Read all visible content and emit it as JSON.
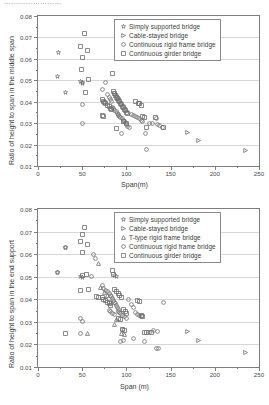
{
  "cut_title": "……………………",
  "charts": [
    {
      "id": "middle-span",
      "type": "scatter",
      "title": "",
      "xlabel": "Span(m)",
      "ylabel": "Ratio of height to span in the middle span",
      "xlim": [
        0,
        250
      ],
      "ylim": [
        0.01,
        0.08
      ],
      "xticks": [
        0,
        50,
        100,
        150,
        200,
        250
      ],
      "yticks": [
        0.01,
        0.02,
        0.03,
        0.04,
        0.05,
        0.06,
        0.07,
        0.08
      ],
      "ytick_labels": [
        "0.01",
        "0.02",
        "0.03",
        "0.04",
        "0.05",
        "0.06",
        "0.07",
        "0.08"
      ],
      "xtick_labels": [
        "0",
        "50",
        "100",
        "150",
        "200",
        "250"
      ],
      "grid": true,
      "legend_position": "top-right",
      "series": [
        {
          "name": "Simply supported bridge",
          "marker": "star",
          "points": [
            [
              22,
              0.0522
            ],
            [
              30,
              0.0447
            ],
            [
              48,
              0.0497
            ],
            [
              50,
              0.0493
            ],
            [
              50,
              0.0487
            ],
            [
              23,
              0.0633
            ]
          ]
        },
        {
          "name": "Cable-stayed bridge",
          "marker": "triangle-right",
          "points": [
            [
              169,
              0.0259
            ],
            [
              181,
              0.0221
            ],
            [
              234,
              0.0176
            ]
          ]
        },
        {
          "name": "Continuous rigid frame bridge",
          "marker": "circle",
          "points": [
            [
              50,
              0.0389
            ],
            [
              50,
              0.0299
            ],
            [
              72,
              0.046
            ],
            [
              76,
              0.0494
            ],
            [
              78,
              0.0437
            ],
            [
              80,
              0.0424
            ],
            [
              82,
              0.0413
            ],
            [
              83,
              0.0402
            ],
            [
              84,
              0.0377
            ],
            [
              85,
              0.037
            ],
            [
              86,
              0.0362
            ],
            [
              88,
              0.0356
            ],
            [
              89,
              0.0349
            ],
            [
              90,
              0.0343
            ],
            [
              91,
              0.0338
            ],
            [
              92,
              0.0333
            ],
            [
              93,
              0.0329
            ],
            [
              95,
              0.0322
            ],
            [
              96,
              0.0316
            ],
            [
              97,
              0.031
            ],
            [
              98,
              0.0304
            ],
            [
              100,
              0.0295
            ],
            [
              101,
              0.0289
            ],
            [
              103,
              0.028
            ],
            [
              94,
              0.0254
            ],
            [
              105,
              0.0344
            ],
            [
              108,
              0.0337
            ],
            [
              110,
              0.0333
            ],
            [
              112,
              0.0329
            ],
            [
              114,
              0.0322
            ],
            [
              116,
              0.0316
            ],
            [
              118,
              0.031
            ],
            [
              121,
              0.0252
            ],
            [
              122,
              0.018
            ],
            [
              126,
              0.0299
            ],
            [
              129,
              0.0302
            ],
            [
              133,
              0.0322
            ],
            [
              135,
              0.0295
            ],
            [
              137,
              0.0291
            ],
            [
              140,
              0.0282
            ],
            [
              86,
              0.0442
            ],
            [
              88,
              0.043
            ],
            [
              90,
              0.0416
            ]
          ]
        },
        {
          "name": "Continuous girder bridge",
          "marker": "square",
          "points": [
            [
              48,
              0.066
            ],
            [
              50,
              0.0609
            ],
            [
              52,
              0.0721
            ],
            [
              55,
              0.0641
            ],
            [
              49,
              0.0553
            ],
            [
              56,
              0.0508
            ],
            [
              53,
              0.0446
            ],
            [
              72,
              0.0411
            ],
            [
              74,
              0.0404
            ],
            [
              75,
              0.0398
            ],
            [
              76,
              0.0392
            ],
            [
              78,
              0.0385
            ],
            [
              80,
              0.0379
            ],
            [
              82,
              0.0372
            ],
            [
              83,
              0.0366
            ],
            [
              84,
              0.0536
            ],
            [
              85,
              0.0449
            ],
            [
              86,
              0.044
            ],
            [
              87,
              0.0432
            ],
            [
              88,
              0.0424
            ],
            [
              89,
              0.0416
            ],
            [
              90,
              0.0409
            ],
            [
              92,
              0.0402
            ],
            [
              93,
              0.0395
            ],
            [
              94,
              0.0388
            ],
            [
              95,
              0.0381
            ],
            [
              96,
              0.0374
            ],
            [
              97,
              0.0367
            ],
            [
              98,
              0.036
            ],
            [
              100,
              0.0353
            ],
            [
              101,
              0.0346
            ],
            [
              88,
              0.0276
            ],
            [
              96,
              0.031
            ],
            [
              99,
              0.0302
            ],
            [
              110,
              0.0402
            ],
            [
              113,
              0.0396
            ],
            [
              114,
              0.0392
            ],
            [
              116,
              0.0386
            ],
            [
              118,
              0.0333
            ],
            [
              120,
              0.0327
            ],
            [
              122,
              0.0281
            ],
            [
              132,
              0.033
            ],
            [
              141,
              0.0282
            ],
            [
              72,
              0.0339
            ],
            [
              74,
              0.0333
            ]
          ]
        }
      ]
    },
    {
      "id": "end-support",
      "type": "scatter",
      "title": "",
      "xlabel": "Span (m)",
      "ylabel": "Ratio of height to span in the end support",
      "xlim": [
        0,
        250
      ],
      "ylim": [
        0.01,
        0.08
      ],
      "xticks": [
        0,
        50,
        100,
        150,
        200,
        250
      ],
      "yticks": [
        0.01,
        0.02,
        0.03,
        0.04,
        0.05,
        0.06,
        0.07,
        0.08
      ],
      "ytick_labels": [
        "0.01",
        "0.02",
        "0.03",
        "0.04",
        "0.05",
        "0.06",
        "0.07",
        "0.08"
      ],
      "xtick_labels": [
        "0",
        "50",
        "100",
        "150",
        "200",
        "250"
      ],
      "grid": true,
      "legend_position": "top-right",
      "series": [
        {
          "name": "Simply supported bridge",
          "marker": "star",
          "points": [
            [
              22,
              0.052
            ],
            [
              30,
              0.0632
            ],
            [
              48,
              0.0502
            ],
            [
              50,
              0.0497
            ],
            [
              86,
              0.0508
            ],
            [
              88,
              0.0503
            ]
          ]
        },
        {
          "name": "Cable-stayed bridge",
          "marker": "triangle-right",
          "points": [
            [
              169,
              0.0259
            ],
            [
              181,
              0.022
            ],
            [
              234,
              0.0167
            ]
          ]
        },
        {
          "name": "T-type rigid frame bridge",
          "marker": "triangle-up",
          "points": [
            [
              55,
              0.0252
            ],
            [
              68,
              0.056
            ],
            [
              70,
              0.0454
            ],
            [
              75,
              0.0432
            ],
            [
              78,
              0.0418
            ],
            [
              82,
              0.0386
            ],
            [
              88,
              0.0312
            ],
            [
              94,
              0.0251
            ],
            [
              97,
              0.0247
            ],
            [
              86,
              0.0291
            ]
          ]
        },
        {
          "name": "Continuous rigid frame bridge",
          "marker": "circle",
          "points": [
            [
              22,
              0.052
            ],
            [
              30,
              0.0632
            ],
            [
              48,
              0.0318
            ],
            [
              50,
              0.0302
            ],
            [
              62,
              0.06
            ],
            [
              64,
              0.0584
            ],
            [
              72,
              0.0462
            ],
            [
              74,
              0.045
            ],
            [
              76,
              0.0442
            ],
            [
              78,
              0.0436
            ],
            [
              80,
              0.0428
            ],
            [
              82,
              0.042
            ],
            [
              83,
              0.0413
            ],
            [
              84,
              0.0406
            ],
            [
              85,
              0.0398
            ],
            [
              86,
              0.039
            ],
            [
              87,
              0.0382
            ],
            [
              88,
              0.0374
            ],
            [
              89,
              0.0366
            ],
            [
              90,
              0.0358
            ],
            [
              91,
              0.035
            ],
            [
              92,
              0.0344
            ],
            [
              93,
              0.0338
            ],
            [
              80,
              0.0352
            ],
            [
              82,
              0.0346
            ],
            [
              84,
              0.034
            ],
            [
              86,
              0.0334
            ],
            [
              95,
              0.033
            ],
            [
              97,
              0.0324
            ],
            [
              99,
              0.0318
            ],
            [
              102,
              0.04
            ],
            [
              105,
              0.038
            ],
            [
              108,
              0.0368
            ],
            [
              110,
              0.0344
            ],
            [
              112,
              0.0336
            ],
            [
              114,
              0.033
            ],
            [
              116,
              0.0324
            ],
            [
              95,
              0.0268
            ],
            [
              93,
              0.0215
            ],
            [
              96,
              0.0221
            ],
            [
              108,
              0.0228
            ],
            [
              120,
              0.0213
            ],
            [
              125,
              0.0256
            ],
            [
              130,
              0.0262
            ],
            [
              135,
              0.0259
            ],
            [
              141,
              0.0386
            ],
            [
              134,
              0.0185
            ],
            [
              136,
              0.0182
            ],
            [
              48,
              0.0252
            ],
            [
              60,
              0.0505
            ]
          ]
        },
        {
          "name": "Continuous girder bridge",
          "marker": "square",
          "points": [
            [
              48,
              0.0658
            ],
            [
              50,
              0.0688
            ],
            [
              52,
              0.0719
            ],
            [
              55,
              0.0643
            ],
            [
              50,
              0.061
            ],
            [
              50,
              0.0507
            ],
            [
              54,
              0.0511
            ],
            [
              48,
              0.0439
            ],
            [
              56,
              0.0446
            ],
            [
              30,
              0.0252
            ],
            [
              72,
              0.041
            ],
            [
              74,
              0.0402
            ],
            [
              76,
              0.0396
            ],
            [
              78,
              0.039
            ],
            [
              80,
              0.0383
            ],
            [
              82,
              0.0376
            ],
            [
              84,
              0.053
            ],
            [
              85,
              0.051
            ],
            [
              86,
              0.0444
            ],
            [
              88,
              0.0436
            ],
            [
              90,
              0.0428
            ],
            [
              92,
              0.042
            ],
            [
              94,
              0.0412
            ],
            [
              96,
              0.0355
            ],
            [
              98,
              0.0348
            ],
            [
              100,
              0.034
            ],
            [
              90,
              0.0318
            ],
            [
              93,
              0.0311
            ],
            [
              112,
              0.0398
            ],
            [
              114,
              0.0392
            ],
            [
              116,
              0.0332
            ],
            [
              118,
              0.0328
            ],
            [
              120,
              0.0256
            ],
            [
              122,
              0.0254
            ],
            [
              128,
              0.0256
            ],
            [
              95,
              0.027
            ],
            [
              97,
              0.0264
            ],
            [
              66,
              0.0415
            ],
            [
              68,
              0.0408
            ]
          ]
        }
      ]
    }
  ]
}
